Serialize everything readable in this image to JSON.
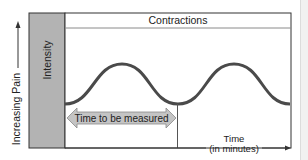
{
  "diagram": {
    "y_axis_label": "Increasing Pain",
    "intensity_label": "Intensity",
    "header_label": "Contractions",
    "measure_label": "Time to be measured",
    "x_axis_label_line1": "Time",
    "x_axis_label_line2": "(in minutes)",
    "colors": {
      "intensity_fill": "#b3b3b3",
      "wave": "#4a4a4a",
      "arrow_fill": "#c4c4c4",
      "border": "#333333"
    }
  }
}
